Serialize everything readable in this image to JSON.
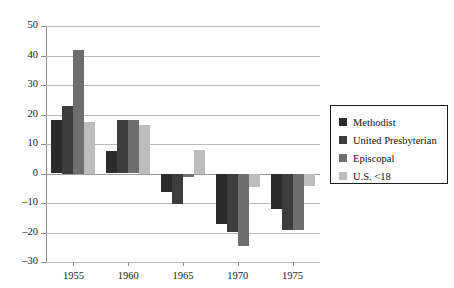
{
  "chart_data": {
    "type": "bar",
    "title": "",
    "subtitle": "",
    "xlabel": "",
    "ylabel": "",
    "categories": [
      "1955",
      "1960",
      "1965",
      "1970",
      "1975"
    ],
    "series": [
      {
        "name": "Methodist",
        "color": "#2b2b2b",
        "values": [
          18,
          7.5,
          -6,
          -17,
          -12
        ]
      },
      {
        "name": "United Presbyterian",
        "color": "#3d3d3d",
        "values": [
          23,
          18,
          -10,
          -19.5,
          -19
        ]
      },
      {
        "name": "Episcopal",
        "color": "#6e6e6e",
        "values": [
          42,
          18,
          -1,
          -24.5,
          -19
        ]
      },
      {
        "name": "U.S. <18",
        "color": "#bdbdbd",
        "values": [
          17.5,
          16.5,
          8,
          -4.5,
          -4
        ]
      }
    ],
    "ylim": [
      -30,
      50
    ],
    "ytick_values": [
      50,
      40,
      30,
      20,
      10,
      0,
      -10,
      -20,
      -30
    ],
    "ytick_labels": [
      "50",
      "40",
      "30",
      "20",
      "10",
      "0",
      "–10",
      "–20",
      "–30"
    ],
    "grid": true,
    "legend_position": "right",
    "legend_entries": [
      "Methodist",
      "United Presbyterian",
      "Episcopal",
      "U.S. <18"
    ]
  },
  "legend": {
    "items": [
      {
        "label": "Methodist",
        "color": "#2b2b2b"
      },
      {
        "label": "United Presbyterian",
        "color": "#3d3d3d"
      },
      {
        "label": "Episcopal",
        "color": "#6e6e6e"
      },
      {
        "label": "U.S. <18",
        "color": "#bdbdbd"
      }
    ]
  }
}
